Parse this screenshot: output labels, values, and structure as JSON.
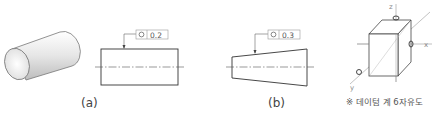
{
  "figure_a": {
    "label": "(a)",
    "tolerance_symbol": "circularity-symbol",
    "tolerance_value": "0.2"
  },
  "figure_b": {
    "label": "(b)",
    "tolerance_symbol": "circularity-symbol",
    "tolerance_value": "0.3"
  },
  "datum_cube": {
    "axes": {
      "x": "x",
      "y": "y",
      "z": "z"
    },
    "caption": "※ 데이텀 계 6자유도"
  }
}
